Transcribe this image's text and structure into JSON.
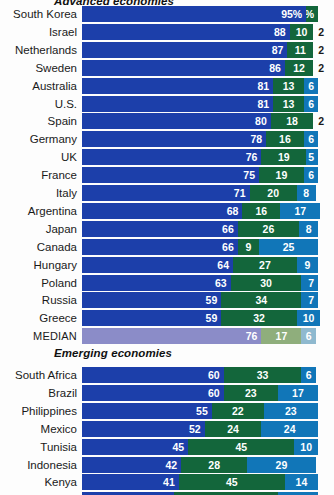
{
  "colors": {
    "series1": "#1c3faa",
    "series2": "#13663b",
    "series3": "#1176b8",
    "median1": "#8b8cc8",
    "median2": "#8fae7c",
    "median3": "#8fb9cf",
    "background": "#fdfdfd",
    "label_text": "#1a1a1a",
    "value_text": "#ffffff"
  },
  "chart_data": {
    "type": "bar",
    "subtype": "stacked-horizontal-100",
    "title": "Advanced economies",
    "xlabel": "",
    "ylabel": "",
    "xlim": [
      0,
      100
    ],
    "grid": false,
    "legend_position": "none",
    "series": [
      {
        "name": "series-1",
        "color": "#1c3faa"
      },
      {
        "name": "series-2",
        "color": "#13663b"
      },
      {
        "name": "series-3",
        "color": "#1176b8"
      }
    ],
    "sections": [
      {
        "header": "Advanced economies",
        "rows": [
          {
            "label": "South Korea",
            "values": [
              95,
              5,
              0
            ],
            "labels": [
              "95%",
              "5%",
              ""
            ],
            "outside": ""
          },
          {
            "label": "Israel",
            "values": [
              88,
              10,
              0
            ],
            "labels": [
              "88",
              "10",
              ""
            ],
            "outside": "2"
          },
          {
            "label": "Netherlands",
            "values": [
              87,
              11,
              0
            ],
            "labels": [
              "87",
              "11",
              ""
            ],
            "outside": "2"
          },
          {
            "label": "Sweden",
            "values": [
              86,
              12,
              0
            ],
            "labels": [
              "86",
              "12",
              ""
            ],
            "outside": "2"
          },
          {
            "label": "Australia",
            "values": [
              81,
              13,
              6
            ],
            "labels": [
              "81",
              "13",
              "6"
            ],
            "outside": ""
          },
          {
            "label": "U.S.",
            "values": [
              81,
              13,
              6
            ],
            "labels": [
              "81",
              "13",
              "6"
            ],
            "outside": ""
          },
          {
            "label": "Spain",
            "values": [
              80,
              18,
              0
            ],
            "labels": [
              "80",
              "18",
              ""
            ],
            "outside": "2"
          },
          {
            "label": "Germany",
            "values": [
              78,
              16,
              6
            ],
            "labels": [
              "78",
              "16",
              "6"
            ],
            "outside": ""
          },
          {
            "label": "UK",
            "values": [
              76,
              19,
              5
            ],
            "labels": [
              "76",
              "19",
              "5"
            ],
            "outside": ""
          },
          {
            "label": "France",
            "values": [
              75,
              19,
              6
            ],
            "labels": [
              "75",
              "19",
              "6"
            ],
            "outside": ""
          },
          {
            "label": "Italy",
            "values": [
              71,
              20,
              8
            ],
            "labels": [
              "71",
              "20",
              "8"
            ],
            "outside": ""
          },
          {
            "label": "Argentina",
            "values": [
              68,
              16,
              17
            ],
            "labels": [
              "68",
              "16",
              "17"
            ],
            "outside": ""
          },
          {
            "label": "Japan",
            "values": [
              66,
              26,
              8
            ],
            "labels": [
              "66",
              "26",
              "8"
            ],
            "outside": ""
          },
          {
            "label": "Canada",
            "values": [
              66,
              9,
              25
            ],
            "labels": [
              "66",
              "9",
              "25"
            ],
            "outside": ""
          },
          {
            "label": "Hungary",
            "values": [
              64,
              27,
              9
            ],
            "labels": [
              "64",
              "27",
              "9"
            ],
            "outside": ""
          },
          {
            "label": "Poland",
            "values": [
              63,
              30,
              7
            ],
            "labels": [
              "63",
              "30",
              "7"
            ],
            "outside": ""
          },
          {
            "label": "Russia",
            "values": [
              59,
              34,
              7
            ],
            "labels": [
              "59",
              "34",
              "7"
            ],
            "outside": ""
          },
          {
            "label": "Greece",
            "values": [
              59,
              32,
              10
            ],
            "labels": [
              "59",
              "32",
              "10"
            ],
            "outside": ""
          },
          {
            "label": "MEDIAN",
            "values": [
              76,
              17,
              6
            ],
            "labels": [
              "76",
              "17",
              "6"
            ],
            "outside": "",
            "median": true
          }
        ]
      },
      {
        "header": "Emerging economies",
        "rows": [
          {
            "label": "South Africa",
            "values": [
              60,
              33,
              6
            ],
            "labels": [
              "60",
              "33",
              "6"
            ],
            "outside": ""
          },
          {
            "label": "Brazil",
            "values": [
              60,
              23,
              17
            ],
            "labels": [
              "60",
              "23",
              "17"
            ],
            "outside": ""
          },
          {
            "label": "Philippines",
            "values": [
              55,
              22,
              23
            ],
            "labels": [
              "55",
              "22",
              "23"
            ],
            "outside": ""
          },
          {
            "label": "Mexico",
            "values": [
              52,
              24,
              24
            ],
            "labels": [
              "52",
              "24",
              "24"
            ],
            "outside": ""
          },
          {
            "label": "Tunisia",
            "values": [
              45,
              45,
              10
            ],
            "labels": [
              "45",
              "45",
              "10"
            ],
            "outside": ""
          },
          {
            "label": "Indonesia",
            "values": [
              42,
              28,
              29
            ],
            "labels": [
              "42",
              "28",
              "29"
            ],
            "outside": ""
          },
          {
            "label": "Kenya",
            "values": [
              41,
              45,
              14
            ],
            "labels": [
              "41",
              "45",
              "14"
            ],
            "outside": ""
          },
          {
            "label": "Nigeria",
            "values": [
              39,
              44,
              17
            ],
            "labels": [
              "39",
              "44",
              "17"
            ],
            "outside": ""
          }
        ]
      }
    ]
  }
}
